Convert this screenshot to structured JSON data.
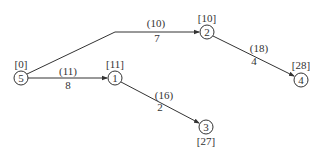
{
  "diagram": {
    "type": "directed-network",
    "nodes": [
      {
        "id": "5",
        "label": "5",
        "value": "[0]",
        "x": 21,
        "y": 78,
        "value_pos": "above"
      },
      {
        "id": "1",
        "label": "1",
        "value": "[11]",
        "x": 115,
        "y": 78,
        "value_pos": "above"
      },
      {
        "id": "2",
        "label": "2",
        "value": "[10]",
        "x": 207,
        "y": 32,
        "value_pos": "above"
      },
      {
        "id": "4",
        "label": "4",
        "value": "[28]",
        "x": 301,
        "y": 80,
        "value_pos": "above"
      },
      {
        "id": "3",
        "label": "3",
        "value": "[27]",
        "x": 206,
        "y": 127,
        "value_pos": "below"
      }
    ],
    "edges": [
      {
        "from": "5",
        "to": "2",
        "top_label": "(10)",
        "bottom_label": "7"
      },
      {
        "from": "5",
        "to": "1",
        "top_label": "(11)",
        "bottom_label": "8"
      },
      {
        "from": "2",
        "to": "4",
        "top_label": "(18)",
        "bottom_label": "4"
      },
      {
        "from": "1",
        "to": "3",
        "top_label": "(16)",
        "bottom_label": "2"
      }
    ],
    "colors": {
      "line": "#333333",
      "text": "#333333",
      "background": "#ffffff"
    }
  }
}
